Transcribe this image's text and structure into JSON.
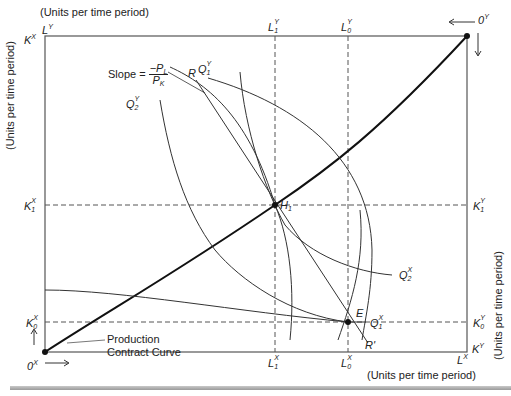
{
  "figure": {
    "top_axis_title": "(Units per time period)",
    "bottom_axis_title": "(Units per time period)",
    "left_axis_title": "(Units per time period)",
    "right_axis_title": "(Units per time period)",
    "contract_curve_label_line1": "Production",
    "contract_curve_label_line2": "Contract Curve",
    "slope_label": "Slope =",
    "slope_numerator": "−P",
    "slope_numerator_sub": "L",
    "slope_denominator": "P",
    "slope_denominator_sub": "K"
  },
  "corners": {
    "origin_x": {
      "base": "0",
      "sup": "X"
    },
    "origin_y": {
      "base": "0",
      "sup": "Y"
    },
    "top_left_k": {
      "base": "K",
      "sup": "X"
    },
    "top_left_l": {
      "base": "L",
      "sup": "Y"
    },
    "bottom_right_l": {
      "base": "L",
      "sup": "X"
    },
    "bottom_right_k": {
      "base": "K",
      "sup": "Y"
    }
  },
  "tick_labels": {
    "L1Y": {
      "base": "L",
      "sup": "Y",
      "sub": "1"
    },
    "L0Y": {
      "base": "L",
      "sup": "Y",
      "sub": "0"
    },
    "L1X": {
      "base": "L",
      "sup": "X",
      "sub": "1"
    },
    "L0X": {
      "base": "L",
      "sup": "X",
      "sub": "0"
    },
    "K1X": {
      "base": "K",
      "sup": "X",
      "sub": "1"
    },
    "K0X": {
      "base": "K",
      "sup": "X",
      "sub": "0"
    },
    "K1Y": {
      "base": "K",
      "sup": "Y",
      "sub": "1"
    },
    "K0Y": {
      "base": "K",
      "sup": "Y",
      "sub": "0"
    }
  },
  "curve_labels": {
    "Q1Y": {
      "base": "Q",
      "sup": "Y",
      "sub": "1"
    },
    "Q2Y": {
      "base": "Q",
      "sup": "Y",
      "sub": "2"
    },
    "Q1X": {
      "base": "Q",
      "sup": "X",
      "sub": "1"
    },
    "Q2X": {
      "base": "Q",
      "sup": "X",
      "sub": "2"
    },
    "R": "R",
    "R_prime": "R'"
  },
  "points": {
    "H1": {
      "base": "H",
      "sub": "1"
    },
    "E": "E"
  },
  "colors": {
    "line": "#222222",
    "dashed": "#555555",
    "background": "#ffffff"
  }
}
